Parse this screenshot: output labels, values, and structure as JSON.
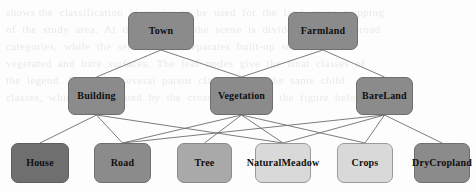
{
  "diagram": {
    "background_color": "#fdfdfd",
    "edge_color": "#6d6d6d",
    "ghost_text": "shows the  classification  hierarchy  to  be  used  for  the  land  cover  mapping\nof  the  study  area.  At  the  top  level  the  scene  is  divided  into  two  broad\ncategories,  while  the  second  level  separates  built-up  surfaces  from\nvegetated  and  bare  surfaces.  The  leaf  nodes  give  the  final  classes  of\nthe  legend.  Note  that  several  parent  classes  share  the  same  child\nclasses,  which  is  indicated  by  the  crossing  links  in  the  figure  below.",
    "levels": [
      {
        "level": 1,
        "nodes": [
          {
            "id": "town",
            "label": "Town",
            "tone": "mid",
            "color": "#8b8b8b",
            "x": 128,
            "y": 12,
            "w": 66,
            "h": 38
          },
          {
            "id": "farmland",
            "label": "Farmland",
            "tone": "mid",
            "color": "#8b8b8b",
            "x": 288,
            "y": 12,
            "w": 70,
            "h": 38
          }
        ]
      },
      {
        "level": 2,
        "nodes": [
          {
            "id": "building",
            "label": "Building",
            "tone": "mid",
            "color": "#8b8b8b",
            "x": 68,
            "y": 77,
            "w": 57,
            "h": 38
          },
          {
            "id": "vegetation",
            "label": "Vegetation",
            "tone": "mid",
            "color": "#8b8b8b",
            "x": 210,
            "y": 77,
            "w": 63,
            "h": 38
          },
          {
            "id": "bareland",
            "label": "Bare\nLand",
            "tone": "mid",
            "color": "#8b8b8b",
            "x": 356,
            "y": 77,
            "w": 57,
            "h": 38
          }
        ]
      },
      {
        "level": 3,
        "nodes": [
          {
            "id": "house",
            "label": "House",
            "tone": "dark",
            "color": "#6f6f6f",
            "x": 11,
            "y": 143,
            "w": 58,
            "h": 40
          },
          {
            "id": "road",
            "label": "Road",
            "tone": "mid",
            "color": "#8b8b8b",
            "x": 94,
            "y": 143,
            "w": 57,
            "h": 40
          },
          {
            "id": "tree",
            "label": "Tree",
            "tone": "midlt",
            "color": "#a9a9a9",
            "x": 177,
            "y": 143,
            "w": 55,
            "h": 40
          },
          {
            "id": "meadow",
            "label": "Natural\nMeadow",
            "tone": "light",
            "color": "#d9d9d9",
            "x": 255,
            "y": 143,
            "w": 56,
            "h": 40
          },
          {
            "id": "crops",
            "label": "Crops",
            "tone": "light",
            "color": "#d9d9d9",
            "x": 337,
            "y": 143,
            "w": 56,
            "h": 40
          },
          {
            "id": "dry",
            "label": "Dry\nCropland",
            "tone": "mid",
            "color": "#8b8b8b",
            "x": 414,
            "y": 143,
            "w": 56,
            "h": 40
          }
        ]
      }
    ],
    "edges": [
      {
        "from": "town",
        "to": "building"
      },
      {
        "from": "town",
        "to": "vegetation"
      },
      {
        "from": "farmland",
        "to": "vegetation"
      },
      {
        "from": "farmland",
        "to": "bareland"
      },
      {
        "from": "building",
        "to": "house"
      },
      {
        "from": "building",
        "to": "road"
      },
      {
        "from": "building",
        "to": "meadow"
      },
      {
        "from": "vegetation",
        "to": "road"
      },
      {
        "from": "vegetation",
        "to": "tree"
      },
      {
        "from": "vegetation",
        "to": "meadow"
      },
      {
        "from": "vegetation",
        "to": "crops"
      },
      {
        "from": "bareland",
        "to": "road"
      },
      {
        "from": "bareland",
        "to": "meadow"
      },
      {
        "from": "bareland",
        "to": "crops"
      },
      {
        "from": "bareland",
        "to": "dry"
      }
    ]
  }
}
